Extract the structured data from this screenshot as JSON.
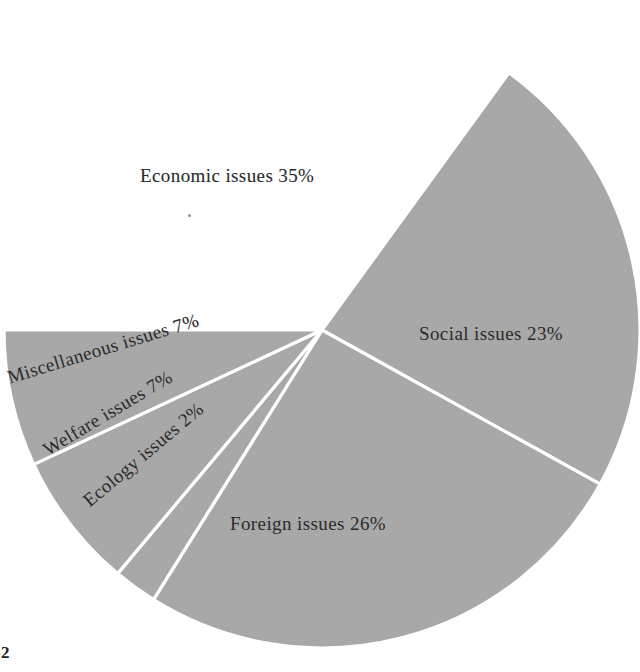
{
  "figure": {
    "background_color": "#ffffff",
    "caption_text": "-2",
    "caption_sub_text": ""
  },
  "chart_data": {
    "type": "pie",
    "title": "",
    "xlabel": "",
    "ylabel": "",
    "legend_position": "none",
    "grid": false,
    "units": "percent",
    "total": 100,
    "slice_color": "#a8a8a8",
    "divider_color": "#ffffff",
    "label_color": "#2b2b2b",
    "categories": [
      "Economic issues",
      "Social issues",
      "Foreign issues",
      "Ecology issues",
      "Welfare issues",
      "Miscellaneous issues"
    ],
    "values": [
      35,
      23,
      26,
      2,
      7,
      7
    ],
    "slices": [
      {
        "name": "Economic issues",
        "value": 35,
        "label": "Economic issues  35%",
        "percent_text": "35%",
        "start_angle_deg": -54,
        "end_angle_deg": 180,
        "label_orientation": "horizontal",
        "label_x": 140,
        "label_y": 165,
        "label_rotation": 0
      },
      {
        "name": "Social issues",
        "value": 23,
        "label": "Social issues  23%",
        "percent_text": "23%",
        "start_angle_deg": -54,
        "end_angle_deg": 29,
        "label_orientation": "horizontal",
        "label_x": 419,
        "label_y": 323,
        "label_rotation": 0
      },
      {
        "name": "Foreign issues",
        "value": 26,
        "label": "Foreign issues  26%",
        "percent_text": "26%",
        "start_angle_deg": 29,
        "end_angle_deg": 122,
        "label_orientation": "horizontal",
        "label_x": 230,
        "label_y": 513,
        "label_rotation": 0
      },
      {
        "name": "Ecology issues",
        "value": 2,
        "label": "Ecology issues  2%",
        "percent_text": "2%",
        "start_angle_deg": 122,
        "end_angle_deg": 130,
        "label_orientation": "rotated",
        "label_x": 86,
        "label_y": 492,
        "label_rotation": -40
      },
      {
        "name": "Welfare issues",
        "value": 7,
        "label": "Welfare issues  7%",
        "percent_text": "7%",
        "start_angle_deg": 130,
        "end_angle_deg": 155,
        "label_orientation": "rotated",
        "label_x": 45,
        "label_y": 440,
        "label_rotation": -31
      },
      {
        "name": "Miscellaneous issues",
        "value": 7,
        "label": "Miscellaneous issues  7%",
        "percent_text": "7%",
        "start_angle_deg": 155,
        "end_angle_deg": 180,
        "label_orientation": "rotated",
        "label_x": 8,
        "label_y": 367,
        "label_rotation": -17
      }
    ],
    "geometry": {
      "center_x": 322,
      "center_y": 330,
      "radius": 318
    }
  }
}
